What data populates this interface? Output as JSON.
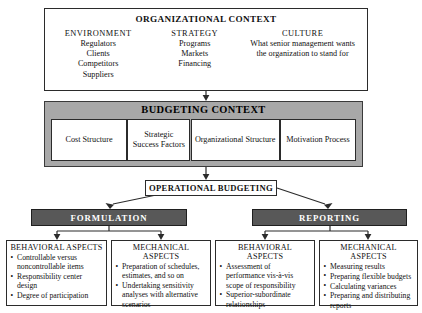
{
  "diagram": {
    "organizational_context": {
      "title": "ORGANIZATIONAL CONTEXT",
      "columns": [
        {
          "heading": "ENVIRONMENT",
          "items": [
            "Regulators",
            "Clients",
            "Competitors",
            "Suppliers"
          ]
        },
        {
          "heading": "STRATEGY",
          "items": [
            "Programs",
            "Markets",
            "Financing"
          ]
        },
        {
          "heading": "CULTURE",
          "text": "What senior management wants the organization to stand for"
        }
      ]
    },
    "budgeting_context": {
      "title": "BUDGETING CONTEXT",
      "boxes": [
        "Cost Structure",
        "Strategic Success Factors",
        "Organizational Structure",
        "Motivation Process"
      ]
    },
    "operational_budgeting": {
      "title": "OPERATIONAL BUDGETING"
    },
    "branches": [
      {
        "label": "FORMULATION"
      },
      {
        "label": "REPORTING"
      }
    ],
    "leaves": [
      {
        "title": "BEHAVIORAL ASPECTS",
        "items": [
          "Controllable versus noncontrollable items",
          "Responsibility center design",
          "Degree of participation"
        ]
      },
      {
        "title": "MECHANICAL ASPECTS",
        "items": [
          "Preparation of schedules, estimates, and so on",
          "Undertaking sensitivity analyses with alternative scenarios"
        ]
      },
      {
        "title": "BEHAVIORAL ASPECTS",
        "items": [
          "Assessment of performance vis-à-vis scope of responsibility",
          "Superior-subordinate relationships"
        ]
      },
      {
        "title": "MECHANICAL ASPECTS",
        "items": [
          "Measuring results",
          "Preparing flexible budgets",
          "Calculating variances",
          "Preparing and distributing reports"
        ]
      }
    ],
    "colors": {
      "band_gray": "#a8a8a8",
      "bar_dark": "#585858",
      "line": "#2b2b2b",
      "background": "#ffffff"
    }
  }
}
